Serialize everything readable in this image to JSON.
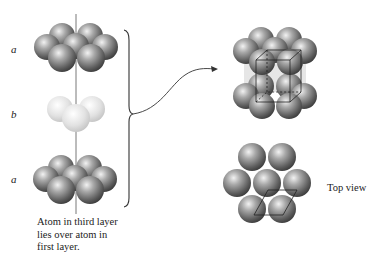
{
  "figure": {
    "left_stack": {
      "layers": [
        {
          "label": "a",
          "shade": "dark"
        },
        {
          "label": "b",
          "shade": "light"
        },
        {
          "label": "a",
          "shade": "dark"
        }
      ],
      "caption_lines": [
        "Atom in third layer",
        "lies over atom in",
        "first layer."
      ]
    },
    "right": {
      "unit_cell_view": "hexagonal closest packed unit cell",
      "top_view_label": "Top view"
    },
    "colors": {
      "dark_sphere": "#6e6e6e",
      "dark_sphere_highlight": "#e8e8e8",
      "light_sphere": "#d6d6d6",
      "light_sphere_highlight": "#ffffff",
      "line": "#333333",
      "background": "#ffffff"
    }
  }
}
